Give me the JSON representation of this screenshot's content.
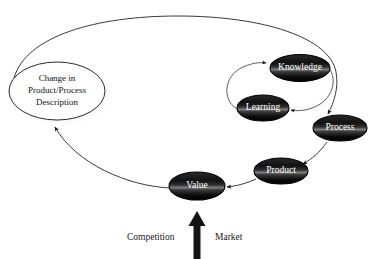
{
  "diagram": {
    "nodes": [
      {
        "id": "change",
        "label_lines": [
          "Change in",
          "Product/Process",
          "Description"
        ],
        "style": "light-ellipse-shadow"
      },
      {
        "id": "knowledge",
        "label": "Knowledge",
        "style": "dark-ellipse"
      },
      {
        "id": "learning",
        "label": "Learning",
        "style": "dark-ellipse"
      },
      {
        "id": "process",
        "label": "Process",
        "style": "dark-ellipse"
      },
      {
        "id": "product",
        "label": "Product",
        "style": "dark-ellipse"
      },
      {
        "id": "value",
        "label": "Value",
        "style": "dark-ellipse"
      }
    ],
    "captions": {
      "left": "Competition",
      "right": "Market"
    },
    "edges": [
      {
        "from": "value",
        "to": "change",
        "arrow": true
      },
      {
        "from": "change",
        "to": "process",
        "arrow": true
      },
      {
        "from": "learning",
        "to": "knowledge",
        "arrow": true
      },
      {
        "from": "knowledge",
        "to": "learning",
        "arrow": true
      },
      {
        "from": "process",
        "to": "product",
        "arrow": true
      },
      {
        "from": "product",
        "to": "value",
        "arrow": true
      },
      {
        "from": "market-competition",
        "to": "value",
        "arrow": true
      }
    ],
    "colors": {
      "background": "#ffffff",
      "node_dark_fill": "#1c1c1c",
      "node_dark_highlight": "#9a9a9a",
      "node_light_fill": "#ffffff",
      "stroke": "#3a3a3a",
      "text_dark": "#111111",
      "text_light": "#ffffff",
      "arrow_block": "#111111",
      "shadow": "#8e8e8e"
    }
  }
}
